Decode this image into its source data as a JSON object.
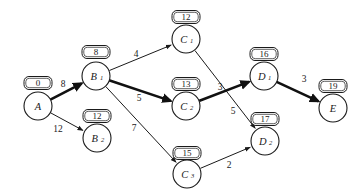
{
  "diagram": {
    "type": "directed-network-critical-path",
    "title": "",
    "width": 357,
    "height": 196,
    "background_color": "#ffffff",
    "stroke_color": "#1a1a1a",
    "critical_path": [
      "A",
      "B1",
      "C2",
      "D1",
      "E"
    ],
    "nodes": [
      {
        "id": "A",
        "label": "A",
        "subscript": "",
        "x": 38,
        "y": 106,
        "r": 14,
        "tag": "0",
        "tag_x": 38,
        "tag_y": 83,
        "tag_w": 28,
        "tag_h": 13
      },
      {
        "id": "B1",
        "label": "B",
        "subscript": "1",
        "x": 96,
        "y": 76,
        "r": 14,
        "tag": "8",
        "tag_x": 96,
        "tag_y": 52,
        "tag_w": 28,
        "tag_h": 13
      },
      {
        "id": "B2",
        "label": "B",
        "subscript": "2",
        "x": 97,
        "y": 138,
        "r": 14,
        "tag": "12",
        "tag_x": 97,
        "tag_y": 116,
        "tag_w": 28,
        "tag_h": 13
      },
      {
        "id": "C1",
        "label": "C",
        "subscript": "1",
        "x": 186,
        "y": 39,
        "r": 14,
        "tag": "12",
        "tag_x": 186,
        "tag_y": 17,
        "tag_w": 28,
        "tag_h": 13
      },
      {
        "id": "C2",
        "label": "C",
        "subscript": "2",
        "x": 186,
        "y": 106,
        "r": 14,
        "tag": "13",
        "tag_x": 186,
        "tag_y": 84,
        "tag_w": 28,
        "tag_h": 13
      },
      {
        "id": "C3",
        "label": "C",
        "subscript": "3",
        "x": 187,
        "y": 174,
        "r": 14,
        "tag": "15",
        "tag_x": 187,
        "tag_y": 153,
        "tag_w": 28,
        "tag_h": 13
      },
      {
        "id": "D1",
        "label": "D",
        "subscript": "1",
        "x": 264,
        "y": 76,
        "r": 14,
        "tag": "16",
        "tag_x": 264,
        "tag_y": 54,
        "tag_w": 28,
        "tag_h": 13
      },
      {
        "id": "D2",
        "label": "D",
        "subscript": "2",
        "x": 265,
        "y": 141,
        "r": 14,
        "tag": "17",
        "tag_x": 265,
        "tag_y": 119,
        "tag_w": 28,
        "tag_h": 13
      },
      {
        "id": "E",
        "label": "E",
        "subscript": "",
        "x": 333,
        "y": 108,
        "r": 14,
        "tag": "19",
        "tag_x": 333,
        "tag_y": 86,
        "tag_w": 28,
        "tag_h": 13
      }
    ],
    "edges": [
      {
        "from": "A",
        "to": "B1",
        "weight": "8",
        "critical": true,
        "label_x": 63,
        "label_y": 84
      },
      {
        "from": "A",
        "to": "B2",
        "weight": "12",
        "critical": false,
        "label_x": 58,
        "label_y": 129
      },
      {
        "from": "B1",
        "to": "C1",
        "weight": "4",
        "critical": false,
        "label_x": 136,
        "label_y": 54
      },
      {
        "from": "B1",
        "to": "C2",
        "weight": "5",
        "critical": true,
        "label_x": 139,
        "label_y": 98
      },
      {
        "from": "B1",
        "to": "C3",
        "weight": "7",
        "critical": false,
        "label_x": 134,
        "label_y": 128
      },
      {
        "from": "C1",
        "to": "D2",
        "weight": "5",
        "critical": false,
        "label_x": 233,
        "label_y": 111
      },
      {
        "from": "C2",
        "to": "D1",
        "weight": "3",
        "critical": true,
        "label_x": 220,
        "label_y": 87
      },
      {
        "from": "C3",
        "to": "D2",
        "weight": "2",
        "critical": false,
        "label_x": 229,
        "label_y": 165
      },
      {
        "from": "D1",
        "to": "E",
        "weight": "3",
        "critical": true,
        "label_x": 304,
        "label_y": 79
      }
    ]
  }
}
